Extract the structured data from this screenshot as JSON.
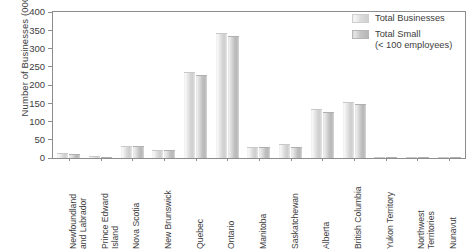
{
  "chart_data": {
    "type": "bar",
    "title": "",
    "xlabel": "",
    "ylabel": "Number of Businesses (000's)",
    "ylim": [
      0,
      400
    ],
    "yticks": [
      0,
      50,
      100,
      150,
      200,
      250,
      300,
      350,
      400
    ],
    "grid": false,
    "legend_position": "top-right",
    "categories": [
      "Newfoundland and Labrador",
      "Prince Edward Island",
      "Nova Scotia",
      "New Brunswick",
      "Quebec",
      "Ontario",
      "Manitoba",
      "Saskatchewan",
      "Alberta",
      "British Columbia",
      "Yukon Territory",
      "Northwest Territories",
      "Nunavut"
    ],
    "category_lines": [
      [
        "Newfoundland",
        "and Labrador"
      ],
      [
        "Prince Edward",
        "Island"
      ],
      [
        "Nova Scotia",
        ""
      ],
      [
        "New Brunswick",
        ""
      ],
      [
        "Quebec",
        ""
      ],
      [
        "Ontario",
        ""
      ],
      [
        "Manitoba",
        ""
      ],
      [
        "Saskatchewan",
        ""
      ],
      [
        "Alberta",
        ""
      ],
      [
        "British Columbia",
        ""
      ],
      [
        "Yukon Territory",
        ""
      ],
      [
        "Northwest",
        "Territories"
      ],
      [
        "Nunavut",
        ""
      ]
    ],
    "series": [
      {
        "name": "Total Businesses",
        "color": "#dedede",
        "values": [
          13,
          5,
          32,
          22,
          235,
          343,
          30,
          38,
          135,
          153,
          2,
          3,
          1
        ]
      },
      {
        "name": "Total Small (< 100 employees)",
        "color": "#c2c2c2",
        "values": [
          12,
          4,
          33,
          23,
          227,
          334,
          30,
          31,
          126,
          148,
          2,
          2,
          1
        ]
      }
    ]
  },
  "legend": {
    "items": [
      {
        "label": "Total Businesses",
        "sub": ""
      },
      {
        "label": "Total Small",
        "sub": "(< 100 employees)"
      }
    ]
  },
  "axis": {
    "y_title": "Number of Businesses (000's)"
  }
}
